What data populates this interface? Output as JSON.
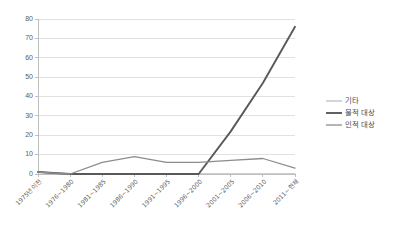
{
  "chart_data": {
    "type": "line",
    "title": "",
    "subtitle": "",
    "xlabel": "",
    "ylabel": "",
    "ylim": [
      0,
      80
    ],
    "yticks": [
      0,
      10,
      20,
      30,
      40,
      50,
      60,
      70,
      80
    ],
    "grid": true,
    "legend_position": "right",
    "categories": [
      "1975년이전",
      "1976~1980",
      "1981~1985",
      "1986~1990",
      "1991~1995",
      "1996~2000",
      "2001~2005",
      "2006~2010",
      "2011~현재"
    ],
    "series": [
      {
        "name": "기타",
        "color": "#bfbfbf",
        "width": 1.3,
        "values": [
          1,
          0,
          0,
          0,
          0,
          0,
          0,
          0,
          0
        ]
      },
      {
        "name": "물적 대상",
        "color": "#595959",
        "width": 1.9,
        "values": [
          1,
          0,
          0,
          0,
          0,
          0,
          22,
          47,
          76
        ]
      },
      {
        "name": "인적 대상",
        "color": "#8c8c8c",
        "width": 1.3,
        "values": [
          1,
          0,
          6,
          9,
          6,
          6,
          7,
          8,
          3
        ]
      }
    ]
  },
  "legend": {
    "items": [
      {
        "label": "기타"
      },
      {
        "label": "물적 대상"
      },
      {
        "label": "인적 대상"
      }
    ]
  },
  "axis": {
    "y_tick_labels": [
      "0",
      "10",
      "20",
      "30",
      "40",
      "50",
      "60",
      "70",
      "80"
    ],
    "x_tick_labels": [
      "1975년이전",
      "1976~1980",
      "1981~1985",
      "1986~1990",
      "1991~1995",
      "1996~2000",
      "2001~2005",
      "2006~2010",
      "2011~현재"
    ]
  }
}
